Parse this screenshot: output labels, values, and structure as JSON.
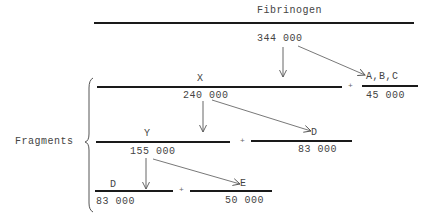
{
  "diagram": {
    "title": "Fibrinogen",
    "fibrinogen_mass": "344  000",
    "group_label": "Fragments",
    "fragments": {
      "x": {
        "label": "X",
        "mass": "240 000"
      },
      "abc": {
        "label": "A,B,C",
        "mass": "45 000"
      },
      "y": {
        "label": "Y",
        "mass": "155 000"
      },
      "d1": {
        "label": "D",
        "mass": "83 000"
      },
      "d2": {
        "label": "D",
        "mass": "83 000"
      },
      "e": {
        "label": "E",
        "mass": "50 000"
      }
    },
    "plus": "+",
    "colors": {
      "line": "#1a1a1a",
      "arrow": "#555555",
      "text": "#444444"
    }
  }
}
